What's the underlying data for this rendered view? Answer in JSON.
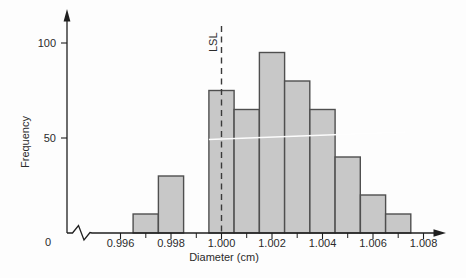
{
  "chart_data": {
    "type": "bar",
    "title": "",
    "xlabel": "Diameter (cm)",
    "ylabel": "Frequency",
    "x": [
      0.997,
      0.998,
      0.999,
      1.0,
      1.001,
      1.002,
      1.003,
      1.004,
      1.005,
      1.006,
      1.007
    ],
    "values": [
      10,
      30,
      0,
      75,
      65,
      95,
      80,
      65,
      40,
      20,
      10
    ],
    "bar_width": 0.001,
    "xlim": [
      0.9945,
      1.0095
    ],
    "ylim": [
      0,
      115
    ],
    "x_major_ticks": [
      0.996,
      0.998,
      1.0,
      1.002,
      1.004,
      1.006,
      1.008
    ],
    "x_major_tick_labels": [
      "0.996",
      "0.998",
      "1.000",
      "1.002",
      "1.004",
      "1.006",
      "1.008"
    ],
    "x_minor_ticks": [
      0.997,
      0.999,
      1.001,
      1.003,
      1.005,
      1.007
    ],
    "y_ticks": [
      50,
      100
    ],
    "y_tick_labels": [
      "50",
      "100"
    ],
    "origin_label": "0",
    "axis_break_on_x": true,
    "grid": false,
    "legend": false,
    "annotations": [
      {
        "type": "vline",
        "x": 1.0,
        "style": "dashed",
        "label": "LSL"
      },
      {
        "type": "white-line",
        "y_value": 50,
        "x_start": 0.9995,
        "x_end": 1.0073,
        "note": "thin white print-artifact line across bars at frequency 50"
      }
    ],
    "colors": {
      "background": "#fdfdfd",
      "bar_fill": "#c8c8c8",
      "bar_stroke": "#4f4f4f",
      "axis": "#1f1f1f",
      "tick": "#1f1f1f",
      "text": "#2b2b2b",
      "lsl_line": "#3a3a3a",
      "artifact_line": "#ffffff"
    }
  }
}
